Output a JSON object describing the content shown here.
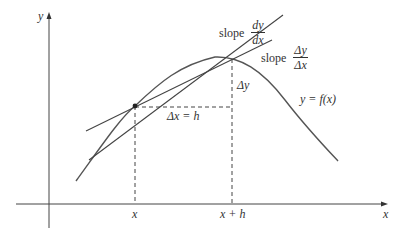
{
  "diagram": {
    "type": "derivative-secant-tangent",
    "colors": {
      "ink": "#333333",
      "curve": "#555555",
      "background": "#ffffff"
    },
    "axes": {
      "x_label": "x",
      "y_label": "y"
    },
    "curve": {
      "label": "y = f(x)"
    },
    "points": {
      "p_xlabel": "x",
      "q_xlabel": "x + h"
    },
    "annotations": {
      "delta_x": "Δx = h",
      "delta_y": "Δy"
    },
    "tangent": {
      "slope_word": "slope",
      "num": "dy",
      "den": "dx"
    },
    "secant": {
      "slope_word": "slope",
      "num": "Δy",
      "den": "Δx"
    }
  }
}
